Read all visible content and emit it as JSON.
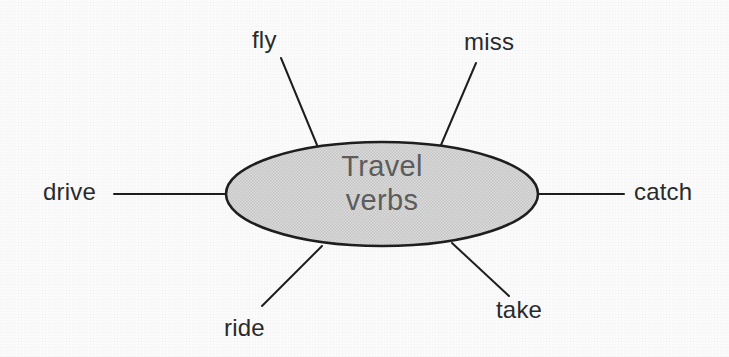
{
  "diagram": {
    "type": "mind-map",
    "center": {
      "label_line1": "Travel",
      "label_line2": "verbs",
      "shape": "ellipse",
      "fill_color": "#d4d4d4",
      "stroke_color": "#1e1e1e",
      "text_color": "#5c5c5c",
      "cx": 382,
      "cy": 194,
      "rx": 156,
      "ry": 52
    },
    "background_color": "#fbfbfb",
    "connector_color": "#1e1e1e",
    "branches": [
      {
        "id": "fly",
        "label": "fly",
        "position": "top-left",
        "line": {
          "x1": 281,
          "y1": 58,
          "x2": 317,
          "y2": 145
        }
      },
      {
        "id": "miss",
        "label": "miss",
        "position": "top-right",
        "line": {
          "x1": 476,
          "y1": 63,
          "x2": 441,
          "y2": 145
        }
      },
      {
        "id": "drive",
        "label": "drive",
        "position": "left",
        "line": {
          "x1": 114,
          "y1": 194,
          "x2": 226,
          "y2": 194
        }
      },
      {
        "id": "catch",
        "label": "catch",
        "position": "right",
        "line": {
          "x1": 538,
          "y1": 194,
          "x2": 624,
          "y2": 194
        }
      },
      {
        "id": "ride",
        "label": "ride",
        "position": "bottom-left",
        "line": {
          "x1": 322,
          "y1": 246,
          "x2": 262,
          "y2": 306
        }
      },
      {
        "id": "take",
        "label": "take",
        "position": "bottom-right",
        "line": {
          "x1": 452,
          "y1": 243,
          "x2": 509,
          "y2": 296
        }
      }
    ]
  }
}
